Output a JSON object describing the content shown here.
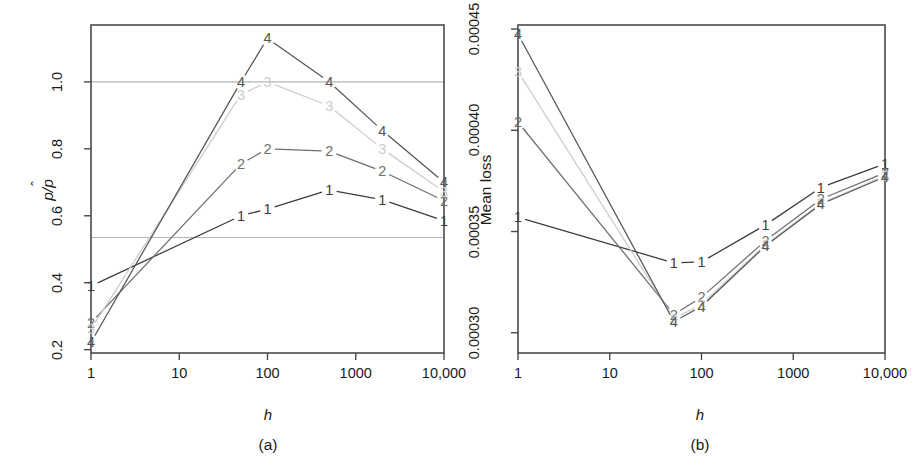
{
  "figure": {
    "background": "#ffffff",
    "panels": [
      {
        "id": "a",
        "caption": "(a)",
        "xlabel": "h",
        "ylabel_parts": {
          "num": "p",
          "den": "p",
          "hat": "̂"
        },
        "ylabel_text": "p/p̂",
        "xticks": [
          "1",
          "10",
          "100",
          "1000",
          "10,000"
        ],
        "yticks": [
          "0.2",
          "0.4",
          "0.6",
          "0.8",
          "1.0"
        ]
      },
      {
        "id": "b",
        "caption": "(b)",
        "xlabel": "h",
        "ylabel_text": "Mean loss",
        "xticks": [
          "1",
          "10",
          "100",
          "1000",
          "10,000"
        ],
        "yticks": [
          "0.00030",
          "0.00035",
          "0.00040",
          "0.00045"
        ]
      }
    ]
  },
  "series_colors": {
    "s1": "#3b3b3b",
    "s2": "#6e6e6e",
    "s3": "#cccccc",
    "s4": "#555555",
    "reference_line": "#b4b4b4",
    "frame": "#4a4a4a"
  },
  "chart_data": [
    {
      "type": "line",
      "panel": "a",
      "title": "",
      "xlabel": "h",
      "ylabel": "p/p̂",
      "xscale": "log",
      "xlim": [
        1,
        10000
      ],
      "ylim": [
        0.19,
        1.17
      ],
      "grid": false,
      "legend": "inline-point-labels",
      "xticks": [
        1,
        10,
        100,
        1000,
        10000
      ],
      "xticklabels": [
        "1",
        "10",
        "100",
        "1000",
        "10,000"
      ],
      "yticks": [
        0.2,
        0.4,
        0.6,
        0.8,
        1.0
      ],
      "yticklabels": [
        "0.2",
        "0.4",
        "0.6",
        "0.8",
        "1.0"
      ],
      "reference_lines": [
        1.0,
        0.535
      ],
      "x": [
        1,
        50,
        100,
        500,
        2000,
        10000
      ],
      "series": [
        {
          "name": "1",
          "marker": "1",
          "values": [
            0.39,
            0.6,
            0.62,
            0.677,
            0.648,
            0.585
          ]
        },
        {
          "name": "2",
          "marker": "2",
          "values": [
            0.28,
            0.755,
            0.8,
            0.793,
            0.733,
            0.645
          ]
        },
        {
          "name": "3",
          "marker": "3",
          "values": [
            0.262,
            0.962,
            1.0,
            0.928,
            0.8,
            0.672
          ]
        },
        {
          "name": "4",
          "marker": "4",
          "values": [
            0.222,
            1.0,
            1.13,
            1.0,
            0.855,
            0.7
          ]
        }
      ]
    },
    {
      "type": "line",
      "panel": "b",
      "title": "",
      "xlabel": "h",
      "ylabel": "Mean loss",
      "xscale": "log",
      "xlim": [
        1,
        10000
      ],
      "ylim": [
        0.00029,
        0.000452
      ],
      "grid": false,
      "legend": "inline-point-labels",
      "xticks": [
        1,
        10,
        100,
        1000,
        10000
      ],
      "xticklabels": [
        "1",
        "10",
        "100",
        "1000",
        "10,000"
      ],
      "yticks": [
        0.0003,
        0.00035,
        0.0004,
        0.00045
      ],
      "yticklabels": [
        "0.00030",
        "0.00035",
        "0.00040",
        "0.00045"
      ],
      "reference_lines": [
        3.97e-05
      ],
      "x": [
        1,
        50,
        100,
        500,
        2000,
        10000
      ],
      "series": [
        {
          "name": "1",
          "marker": "1",
          "values": [
            0.000357,
            0.0003345,
            0.000335,
            0.0003533,
            0.0003717,
            0.0003835
          ]
        },
        {
          "name": "2",
          "marker": "2",
          "values": [
            0.000404,
            0.000309,
            0.0003175,
            0.0003455,
            0.000366,
            0.000379
          ]
        },
        {
          "name": "3",
          "marker": "3",
          "values": [
            0.000429,
            0.000307,
            0.000314,
            0.0003435,
            0.000364,
            0.0003775
          ]
        },
        {
          "name": "4",
          "marker": "4",
          "values": [
            0.0004475,
            0.0003055,
            0.000313,
            0.000343,
            0.0003635,
            0.000377
          ]
        }
      ]
    }
  ]
}
